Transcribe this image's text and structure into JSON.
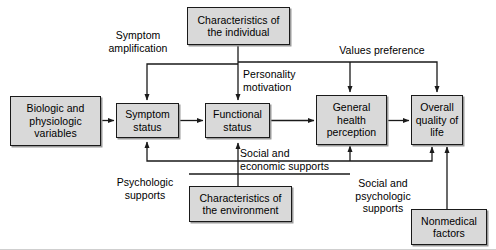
{
  "diagram": {
    "nodes": [
      {
        "id": "biologic",
        "label": "Biologic and\nphysiologic\nvariables"
      },
      {
        "id": "symptom",
        "label": "Symptom\nstatus"
      },
      {
        "id": "functional",
        "label": "Functional\nstatus"
      },
      {
        "id": "general",
        "label": "General\nhealth\nperception"
      },
      {
        "id": "overall",
        "label": "Overall\nquality\nof life"
      },
      {
        "id": "individual",
        "label": "Characteristics of\nthe individual"
      },
      {
        "id": "environment",
        "label": "Characteristics of\nthe environment"
      },
      {
        "id": "nonmedical",
        "label": "Nonmedical\nfactors"
      }
    ],
    "edge_labels": [
      {
        "id": "symptom-amplification",
        "label": "Symptom\namplification"
      },
      {
        "id": "personality-motivation",
        "label": "Personality\nmotivation"
      },
      {
        "id": "values-preference",
        "label": "Values preference"
      },
      {
        "id": "psychologic-supports",
        "label": "Psychologic\nsupports"
      },
      {
        "id": "social-economic-supports",
        "label": "Social and\neconomic supports"
      },
      {
        "id": "social-psychologic-supports",
        "label": "Social and\npsychologic\nsupports"
      }
    ],
    "colors": {
      "box_fill": "#d9d9d9",
      "box_border": "#1a1a1a",
      "line": "#1a1a1a",
      "text": "#000000",
      "background": "#ffffff"
    }
  }
}
